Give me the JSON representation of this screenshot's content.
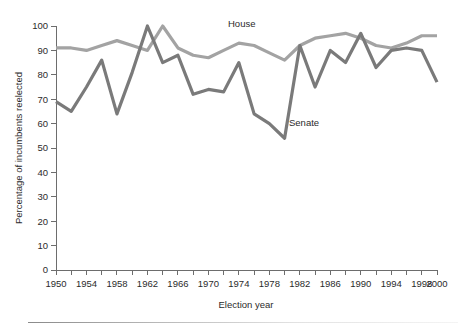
{
  "chart_data": {
    "type": "line",
    "title": "",
    "xlabel": "Election year",
    "ylabel": "Percentage of incumbents reelected",
    "xlim": [
      1950,
      2000
    ],
    "ylim": [
      0,
      100
    ],
    "grid": false,
    "legend_position": "inline-annotation",
    "x_tick_labels": [
      "1950",
      "1954",
      "1958",
      "1962",
      "1966",
      "1970",
      "1974",
      "1978",
      "1982",
      "1986",
      "1990",
      "1994",
      "1998",
      "2000"
    ],
    "x_tick_values": [
      1950,
      1954,
      1958,
      1962,
      1966,
      1970,
      1974,
      1978,
      1982,
      1986,
      1990,
      1994,
      1998,
      2000
    ],
    "x_minor_ticks": [
      1952,
      1956,
      1960,
      1964,
      1968,
      1972,
      1976,
      1980,
      1984,
      1988,
      1992,
      1996
    ],
    "y_tick_labels": [
      "0",
      "10",
      "20",
      "30",
      "40",
      "50",
      "60",
      "70",
      "80",
      "90",
      "100"
    ],
    "y_tick_values": [
      0,
      10,
      20,
      30,
      40,
      50,
      60,
      70,
      80,
      90,
      100
    ],
    "x": [
      1950,
      1952,
      1954,
      1956,
      1958,
      1960,
      1962,
      1964,
      1966,
      1968,
      1970,
      1972,
      1974,
      1976,
      1978,
      1980,
      1982,
      1984,
      1986,
      1988,
      1990,
      1992,
      1994,
      1996,
      1998,
      2000
    ],
    "series": [
      {
        "name": "House",
        "color": "#a3a3a3",
        "label": "House",
        "values": [
          91,
          91,
          90,
          92,
          94,
          92,
          90,
          100,
          91,
          88,
          87,
          90,
          93,
          92,
          89,
          86,
          92,
          95,
          96,
          97,
          95,
          92,
          91,
          93,
          96,
          96
        ]
      },
      {
        "name": "Senate",
        "color": "#7a7a7a",
        "label": "Senate",
        "values": [
          69,
          65,
          75,
          86,
          64,
          81,
          100,
          85,
          88,
          72,
          74,
          73,
          85,
          64,
          60,
          54,
          92,
          75,
          90,
          85,
          97,
          83,
          90,
          91,
          90,
          77
        ]
      }
    ],
    "annotations": [
      {
        "text": "House",
        "x_px": 228,
        "y_px": 27
      },
      {
        "text": "Senate",
        "x_px": 289,
        "y_px": 126
      }
    ]
  },
  "axes": {
    "x_title": "Election year",
    "y_title": "Percentage of incumbents reelected"
  }
}
